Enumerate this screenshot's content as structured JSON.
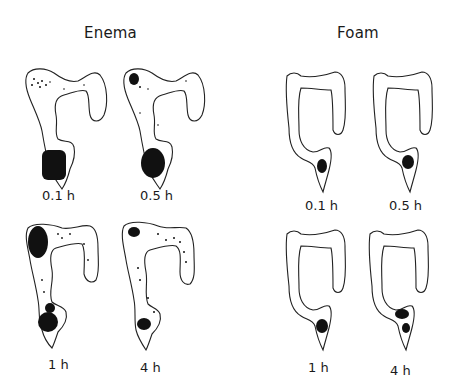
{
  "panels": [
    {
      "title": "Enema",
      "images": [
        {
          "label": "0.1 h",
          "distribution": "dense in rectum/sigmoid, scattered in transverse colon"
        },
        {
          "label": "0.5 h",
          "distribution": "dense in rectum, cluster near splenic flexure"
        },
        {
          "label": "1 h",
          "distribution": "dense in descending colon and sigmoid, scattered throughout"
        },
        {
          "label": "4 h",
          "distribution": "clusters near splenic flexure and rectum, scattered throughout"
        }
      ]
    },
    {
      "title": "Foam",
      "images": [
        {
          "label": "0.1 h",
          "distribution": "confined to rectum"
        },
        {
          "label": "0.5 h",
          "distribution": "confined to rectum/sigmoid junction"
        },
        {
          "label": "1 h",
          "distribution": "confined to rectum"
        },
        {
          "label": "4 h",
          "distribution": "rectum and distal sigmoid"
        }
      ]
    }
  ],
  "colors": {
    "ink": "#222222",
    "background": "#ffffff"
  }
}
